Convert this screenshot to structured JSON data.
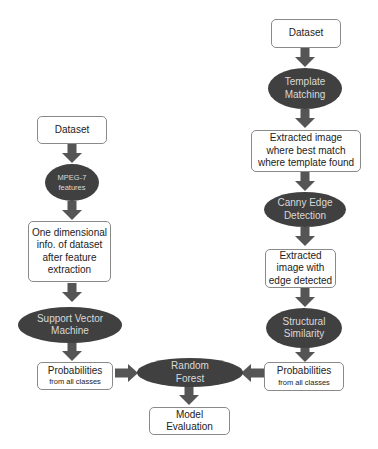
{
  "diagram": {
    "type": "flowchart",
    "colors": {
      "ellipse_fill": "#404040",
      "ellipse_text": "#d9d9d9",
      "box_border": "#8a8a8a",
      "arrow": "#555555"
    },
    "left_branch": {
      "dataset": "Dataset",
      "mpeg7": {
        "line1": "MPEG-7",
        "line2": "features"
      },
      "one_dim": {
        "line1": "One dimensional",
        "line2": "info. of dataset",
        "line3": "after feature",
        "line4": "extraction"
      },
      "svm": {
        "line1": "Support Vector",
        "line2": "Machine"
      },
      "probabilities": {
        "title": "Probabilities",
        "subtitle": "from all classes"
      }
    },
    "right_branch": {
      "dataset": "Dataset",
      "template_matching": {
        "line1": "Template",
        "line2": "Matching"
      },
      "extracted_best_match": {
        "line1": "Extracted image",
        "line2": "where best match",
        "line3": "where template found"
      },
      "canny": {
        "line1": "Canny Edge",
        "line2": "Detection"
      },
      "extracted_edge": {
        "line1": "Extracted",
        "line2": "image with",
        "line3": "edge detected"
      },
      "structural_similarity": {
        "line1": "Structural",
        "line2": "Similarity"
      },
      "probabilities": {
        "title": "Probabilities",
        "subtitle": "from all classes"
      }
    },
    "merge": {
      "random_forest": {
        "line1": "Random",
        "line2": "Forest"
      },
      "model_evaluation": {
        "line1": "Model",
        "line2": "Evaluation"
      }
    },
    "edges": [
      [
        "left.dataset",
        "left.mpeg7"
      ],
      [
        "left.mpeg7",
        "left.one_dim"
      ],
      [
        "left.one_dim",
        "left.svm"
      ],
      [
        "left.svm",
        "left.probabilities"
      ],
      [
        "left.probabilities",
        "random_forest"
      ],
      [
        "right.dataset",
        "right.template_matching"
      ],
      [
        "right.template_matching",
        "right.extracted_best_match"
      ],
      [
        "right.extracted_best_match",
        "right.canny"
      ],
      [
        "right.canny",
        "right.extracted_edge"
      ],
      [
        "right.extracted_edge",
        "right.structural_similarity"
      ],
      [
        "right.structural_similarity",
        "right.probabilities"
      ],
      [
        "right.probabilities",
        "random_forest"
      ],
      [
        "random_forest",
        "model_evaluation"
      ]
    ]
  }
}
